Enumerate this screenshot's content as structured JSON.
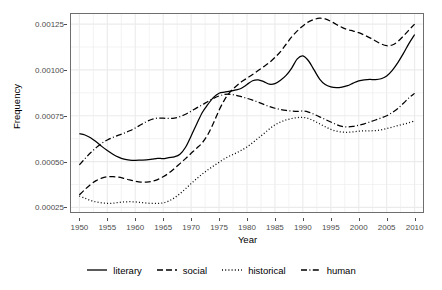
{
  "chart_data": {
    "type": "line",
    "title": "",
    "xlabel": "Year",
    "ylabel": "Frequency",
    "xlim": [
      1948.5,
      2011.5
    ],
    "ylim": [
      0.000225,
      0.001305
    ],
    "grid": true,
    "legend_position": "bottom",
    "x_ticks": [
      1950,
      1955,
      1960,
      1965,
      1970,
      1975,
      1980,
      1985,
      1990,
      1995,
      2000,
      2005,
      2010
    ],
    "x_tick_labels": [
      "1950",
      "1955",
      "1960",
      "1965",
      "1970",
      "1975",
      "1980",
      "1985",
      "1990",
      "1995",
      "2000",
      "2005",
      "2010"
    ],
    "y_ticks": [
      0.00025,
      0.0005,
      0.00075,
      0.001,
      0.00125
    ],
    "y_tick_labels": [
      "0.00025",
      "0.00050",
      "0.00075",
      "0.00100",
      "0.00125"
    ],
    "x": [
      1950,
      1951,
      1952,
      1953,
      1954,
      1955,
      1956,
      1957,
      1958,
      1959,
      1960,
      1961,
      1962,
      1963,
      1964,
      1965,
      1966,
      1967,
      1968,
      1969,
      1970,
      1971,
      1972,
      1973,
      1974,
      1975,
      1976,
      1977,
      1978,
      1979,
      1980,
      1981,
      1982,
      1983,
      1984,
      1985,
      1986,
      1987,
      1988,
      1989,
      1990,
      1991,
      1992,
      1993,
      1994,
      1995,
      1996,
      1997,
      1998,
      1999,
      2000,
      2001,
      2002,
      2003,
      2004,
      2005,
      2006,
      2007,
      2008,
      2009,
      2010
    ],
    "series": [
      {
        "name": "literary",
        "dash": "solid",
        "color": "#000000",
        "values": [
          0.000652,
          0.000645,
          0.00063,
          0.000608,
          0.000583,
          0.00056,
          0.00054,
          0.000524,
          0.000513,
          0.000508,
          0.000507,
          0.000508,
          0.000509,
          0.000513,
          0.000518,
          0.000516,
          0.000522,
          0.000526,
          0.00054,
          0.000578,
          0.00064,
          0.000705,
          0.000768,
          0.000812,
          0.00085,
          0.000873,
          0.000879,
          0.000884,
          0.000891,
          0.0009,
          0.00092,
          0.000941,
          0.000946,
          0.000936,
          0.000922,
          0.000925,
          0.000944,
          0.00097,
          0.00101,
          0.00106,
          0.001077,
          0.00105,
          0.001,
          0.00095,
          0.00092,
          0.000907,
          0.000903,
          0.000906,
          0.000914,
          0.000928,
          0.00094,
          0.000946,
          0.000948,
          0.000947,
          0.000952,
          0.000967,
          0.000998,
          0.00104,
          0.00109,
          0.001145,
          0.001193
        ]
      },
      {
        "name": "social",
        "dash": "dashed",
        "color": "#000000",
        "values": [
          0.000318,
          0.000348,
          0.000375,
          0.000396,
          0.00041,
          0.000417,
          0.000418,
          0.000415,
          0.000408,
          0.0004,
          0.000393,
          0.000388,
          0.000388,
          0.000392,
          0.000402,
          0.000417,
          0.000437,
          0.000462,
          0.000489,
          0.000516,
          0.000545,
          0.000573,
          0.000603,
          0.000648,
          0.00071,
          0.00078,
          0.000838,
          0.00088,
          0.00091,
          0.000935,
          0.000955,
          0.000975,
          0.000997,
          0.001018,
          0.00104,
          0.001068,
          0.0011,
          0.00114,
          0.00118,
          0.001213,
          0.00124,
          0.001262,
          0.001275,
          0.001282,
          0.001278,
          0.001265,
          0.001248,
          0.001232,
          0.00122,
          0.001212,
          0.001203,
          0.00119,
          0.001175,
          0.001158,
          0.001142,
          0.001132,
          0.001136,
          0.001155,
          0.001185,
          0.001218,
          0.00125
        ]
      },
      {
        "name": "historical",
        "dash": "dotted",
        "color": "#000000",
        "values": [
          0.000312,
          0.0003,
          0.000288,
          0.00028,
          0.000275,
          0.000272,
          0.000273,
          0.000277,
          0.00028,
          0.000281,
          0.00028,
          0.000277,
          0.000274,
          0.000272,
          0.000272,
          0.000275,
          0.000285,
          0.000302,
          0.000325,
          0.000352,
          0.00038,
          0.000407,
          0.000432,
          0.000455,
          0.000476,
          0.000496,
          0.000516,
          0.000532,
          0.000546,
          0.000562,
          0.00058,
          0.000603,
          0.000628,
          0.000652,
          0.000678,
          0.0007,
          0.000716,
          0.000727,
          0.000735,
          0.00074,
          0.000741,
          0.000735,
          0.000722,
          0.000706,
          0.00069,
          0.000676,
          0.000666,
          0.000661,
          0.00066,
          0.000662,
          0.000666,
          0.000668,
          0.000668,
          0.000669,
          0.000673,
          0.00068,
          0.000688,
          0.000696,
          0.000704,
          0.000712,
          0.000722
        ]
      },
      {
        "name": "human",
        "dash": "dashdot",
        "color": "#000000",
        "values": [
          0.000482,
          0.000516,
          0.000548,
          0.000576,
          0.0006,
          0.000618,
          0.000632,
          0.000644,
          0.000655,
          0.000668,
          0.000683,
          0.000701,
          0.000718,
          0.000731,
          0.000737,
          0.000737,
          0.000735,
          0.000737,
          0.000745,
          0.000758,
          0.000775,
          0.000793,
          0.00081,
          0.000828,
          0.000845,
          0.000858,
          0.000866,
          0.000867,
          0.000862,
          0.000854,
          0.000845,
          0.000835,
          0.000824,
          0.000812,
          0.0008,
          0.000791,
          0.000784,
          0.000779,
          0.000776,
          0.000774,
          0.000776,
          0.00077,
          0.000758,
          0.000744,
          0.00073,
          0.000716,
          0.000702,
          0.000692,
          0.000689,
          0.000692,
          0.000698,
          0.000706,
          0.000716,
          0.000727,
          0.000738,
          0.00075,
          0.000768,
          0.00079,
          0.000818,
          0.000848,
          0.000872
        ]
      }
    ]
  },
  "axes": {
    "y_title": "Frequency",
    "x_title": "Year"
  },
  "legend": {
    "items": [
      {
        "label": "literary",
        "key": "solid-line-key"
      },
      {
        "label": "social",
        "key": "dashed-line-key"
      },
      {
        "label": "historical",
        "key": "dotted-line-key"
      },
      {
        "label": "human",
        "key": "dashdot-line-key"
      }
    ]
  },
  "style": {
    "panel_border": "#6e6e6e",
    "grid_color": "#ebebeb",
    "tick_label_color": "#4d4d4d",
    "line_color": "#000000",
    "background": "#ffffff"
  }
}
